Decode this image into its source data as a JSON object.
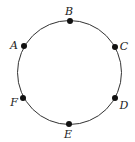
{
  "diagram": {
    "type": "circle-with-points",
    "points": [
      {
        "id": "B",
        "label": "B"
      },
      {
        "id": "C",
        "label": "C"
      },
      {
        "id": "D",
        "label": "D"
      },
      {
        "id": "E",
        "label": "E"
      },
      {
        "id": "F",
        "label": "F"
      },
      {
        "id": "A",
        "label": "A"
      }
    ],
    "colors": {
      "stroke": "#333333",
      "point": "#111111",
      "label": "#222222"
    }
  }
}
